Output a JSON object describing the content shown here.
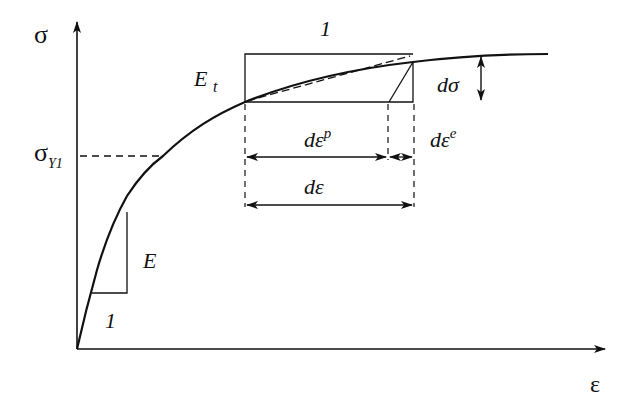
{
  "diagram": {
    "type": "stress-strain curve (elastoplastic, tangent modulus)",
    "axes": {
      "y_label": "σ",
      "x_label": "ε"
    },
    "labels": {
      "yield_stress_symbol": "σ",
      "yield_stress_subscript": "Y1",
      "elastic_modulus": "E",
      "elastic_slope_run": "1",
      "tangent_modulus": "E",
      "tangent_modulus_subscript": "t",
      "tangent_slope_run": "1",
      "stress_increment": "dσ",
      "plastic_strain_increment": "dε",
      "plastic_strain_superscript": "p",
      "elastic_strain_increment": "dε",
      "elastic_strain_superscript": "e",
      "total_strain_increment": "dε"
    },
    "colors": {
      "ink": "#111111",
      "background": "#ffffff"
    }
  }
}
